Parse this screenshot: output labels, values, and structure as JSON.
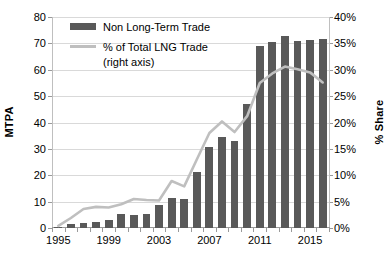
{
  "chart_data": {
    "type": "bar",
    "title": "",
    "xlabel": "",
    "ylabel": "MTPA",
    "y2label": "% Share",
    "ylim": [
      0,
      80
    ],
    "y2lim": [
      0,
      0.4
    ],
    "grid": true,
    "legend_position": "top-left",
    "x": [
      1995,
      1996,
      1997,
      1998,
      1999,
      2000,
      2001,
      2002,
      2003,
      2004,
      2005,
      2006,
      2007,
      2008,
      2009,
      2010,
      2011,
      2012,
      2013,
      2014,
      2015,
      2016
    ],
    "xticks": [
      "1995",
      "1999",
      "2003",
      "2007",
      "2011",
      "2015"
    ],
    "xtick_values": [
      1995,
      1999,
      2003,
      2007,
      2011,
      2015
    ],
    "yticks": [
      "0",
      "10",
      "20",
      "30",
      "40",
      "50",
      "60",
      "70",
      "80"
    ],
    "ytick_values": [
      0,
      10,
      20,
      30,
      40,
      50,
      60,
      70,
      80
    ],
    "y2ticks": [
      "0%",
      "5%",
      "10%",
      "15%",
      "20%",
      "25%",
      "30%",
      "35%",
      "40%"
    ],
    "y2tick_values": [
      0,
      5,
      10,
      15,
      20,
      25,
      30,
      35,
      40
    ],
    "series": [
      {
        "name": "Non Long-Term Trade",
        "type": "bar",
        "axis": "left",
        "color": "#595959",
        "values": [
          0.3,
          1.5,
          2.0,
          2.3,
          3.2,
          5.2,
          5.1,
          5.4,
          8.7,
          11.3,
          11.0,
          21.4,
          30.6,
          34.4,
          33.0,
          47.0,
          69.1,
          70.4,
          72.8,
          71.0,
          71.2,
          71.7
        ]
      },
      {
        "name": "% of Total LNG Trade (right axis)",
        "type": "line",
        "axis": "right",
        "color": "#bfbfbf",
        "values": [
          0.4,
          1.9,
          3.6,
          4.0,
          3.9,
          4.5,
          5.5,
          5.3,
          5.2,
          8.9,
          7.9,
          13.0,
          18.0,
          20.2,
          18.2,
          21.2,
          27.5,
          29.3,
          30.6,
          30.1,
          29.5,
          27.6
        ]
      }
    ],
    "legend": [
      {
        "label": "Non Long-Term Trade",
        "marker": "bar",
        "color": "#595959"
      },
      {
        "label": "% of Total LNG Trade",
        "marker": "line",
        "color": "#bfbfbf"
      }
    ],
    "legend_sub": "(right axis)"
  }
}
